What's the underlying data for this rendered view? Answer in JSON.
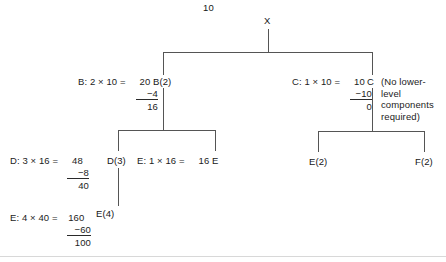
{
  "diagram": {
    "type": "work-breakdown-tree-with-calculations",
    "root_value_label": "10",
    "nodes": {
      "root": "X",
      "level1_left": "B(2)",
      "level1_right": "C",
      "level2_left": "D(3)",
      "level2_mid": "E",
      "level2_right_a": "E(2)",
      "level2_right_b": "F(2)",
      "level3_left": "E(4)"
    },
    "note": "(No lower-level components required)",
    "calculations": [
      {
        "id": "calc-b",
        "lead": "B: 2 × 10 =",
        "product": "20",
        "subtrahend": "−4",
        "total": "16"
      },
      {
        "id": "calc-c",
        "lead": "C: 1 × 10 =",
        "product": "10",
        "subtrahend": "−10",
        "total": "0"
      },
      {
        "id": "calc-d",
        "lead": "D: 3 × 16 =",
        "product": "48",
        "subtrahend": "−8",
        "total": "40"
      },
      {
        "id": "calc-e-mid",
        "lead": "E: 1 × 16 =",
        "product": "16",
        "subtrahend": "",
        "total": ""
      },
      {
        "id": "calc-e-bottom",
        "lead": "E: 4 × 40 =",
        "product": "160",
        "subtrahend": "−60",
        "total": "100"
      }
    ],
    "colors": {
      "ink": "#161616",
      "line": "#555555",
      "background": "#ffffff",
      "baseline": "#d8d8d8"
    }
  }
}
